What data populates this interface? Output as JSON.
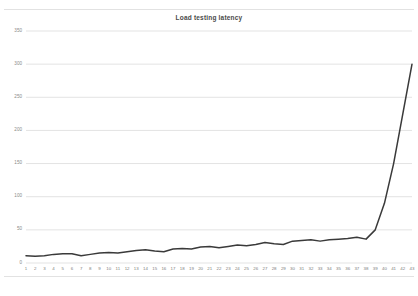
{
  "chart_data": {
    "type": "line",
    "title": "Load testing latency",
    "xlabel": "",
    "ylabel": "",
    "grid": true,
    "legend": false,
    "legend_position": "none",
    "line_color": "#3a3a3a",
    "gridline_color": "#e3e3e3",
    "background_color": "#ffffff",
    "ylim": [
      0,
      350
    ],
    "y_ticks": [
      0,
      50,
      100,
      150,
      200,
      250,
      300,
      350
    ],
    "y_tick_labels": [
      "0",
      "50",
      "100",
      "150",
      "200",
      "250",
      "300",
      "350"
    ],
    "xlim": [
      1,
      43
    ],
    "x_ticks": [
      1,
      2,
      3,
      4,
      5,
      6,
      7,
      8,
      9,
      10,
      11,
      12,
      13,
      14,
      15,
      16,
      17,
      18,
      19,
      20,
      21,
      22,
      23,
      24,
      25,
      26,
      27,
      28,
      29,
      30,
      31,
      32,
      33,
      34,
      35,
      36,
      37,
      38,
      39,
      40,
      41,
      42,
      43
    ],
    "categories": [
      "1",
      "2",
      "3",
      "4",
      "5",
      "6",
      "7",
      "8",
      "9",
      "10",
      "11",
      "12",
      "13",
      "14",
      "15",
      "16",
      "17",
      "18",
      "19",
      "20",
      "21",
      "22",
      "23",
      "24",
      "25",
      "26",
      "27",
      "28",
      "29",
      "30",
      "31",
      "32",
      "33",
      "34",
      "35",
      "36",
      "37",
      "38",
      "39",
      "40",
      "41",
      "42",
      "43"
    ],
    "x": [
      1,
      2,
      3,
      4,
      5,
      6,
      7,
      8,
      9,
      10,
      11,
      12,
      13,
      14,
      15,
      16,
      17,
      18,
      19,
      20,
      21,
      22,
      23,
      24,
      25,
      26,
      27,
      28,
      29,
      30,
      31,
      32,
      33,
      34,
      35,
      36,
      37,
      38,
      39,
      40,
      41,
      42,
      43
    ],
    "values": [
      11,
      10,
      11,
      13,
      14,
      14,
      11,
      13,
      15,
      16,
      15,
      17,
      19,
      20,
      18,
      17,
      21,
      22,
      21,
      24,
      25,
      23,
      25,
      27,
      26,
      28,
      31,
      29,
      28,
      33,
      34,
      35,
      33,
      35,
      36,
      37,
      39,
      36,
      50,
      90,
      150,
      225,
      300
    ],
    "series": [
      {
        "name": "latency",
        "values": [
          11,
          10,
          11,
          13,
          14,
          14,
          11,
          13,
          15,
          16,
          15,
          17,
          19,
          20,
          18,
          17,
          21,
          22,
          21,
          24,
          25,
          23,
          25,
          27,
          26,
          28,
          31,
          29,
          28,
          33,
          34,
          35,
          33,
          35,
          36,
          37,
          39,
          36,
          50,
          90,
          150,
          225,
          300
        ]
      }
    ]
  }
}
